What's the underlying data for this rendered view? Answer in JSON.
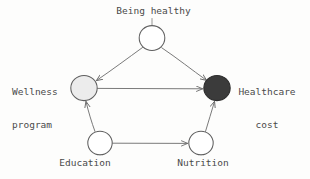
{
  "diagram": {
    "background_color": "#fdfdfc",
    "stroke_color": "#6b6b6b",
    "text_color": "#4a4a4a",
    "nodes": [
      {
        "id": "being_healthy",
        "label": "Being healthy",
        "fill": "#ffffff",
        "cx": 152,
        "cy": 38,
        "r": 13
      },
      {
        "id": "wellness_program",
        "label": "Wellness\nprogram",
        "label_line1": "Wellness",
        "label_line2": "program",
        "fill": "#ececec",
        "cx": 84,
        "cy": 88,
        "r": 13
      },
      {
        "id": "healthcare_cost",
        "label": "Healthcare\ncost",
        "label_line1": "Healthcare",
        "label_line2": "cost",
        "fill": "#3b3b3b",
        "cx": 217,
        "cy": 88,
        "r": 13
      },
      {
        "id": "education",
        "label": "Education",
        "fill": "#ffffff",
        "cx": 100,
        "cy": 143,
        "r": 12
      },
      {
        "id": "nutrition",
        "label": "Nutrition",
        "fill": "#ffffff",
        "cx": 201,
        "cy": 143,
        "r": 12
      }
    ],
    "edges": [
      {
        "id": "edge-being-healthy-to-wellness",
        "from": "being_healthy",
        "to": "wellness_program",
        "arrow": true
      },
      {
        "id": "edge-being-healthy-to-healthcare-cost",
        "from": "being_healthy",
        "to": "healthcare_cost",
        "arrow": true
      },
      {
        "id": "edge-wellness-to-healthcare-cost",
        "from": "wellness_program",
        "to": "healthcare_cost",
        "arrow": true
      },
      {
        "id": "edge-education-to-wellness",
        "from": "education",
        "to": "wellness_program",
        "arrow": true
      },
      {
        "id": "edge-education-to-nutrition",
        "from": "education",
        "to": "nutrition",
        "arrow": true
      },
      {
        "id": "edge-nutrition-to-healthcare-cost",
        "from": "nutrition",
        "to": "healthcare_cost",
        "arrow": true
      }
    ]
  }
}
